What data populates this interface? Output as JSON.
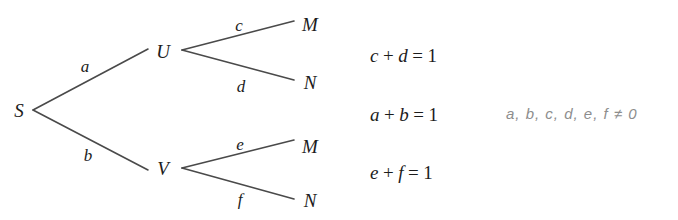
{
  "figure": {
    "type": "probability-tree-diagram",
    "background_color": "#ffffff",
    "line_color": "#4a4a4a",
    "text_color": "#1c1c1c",
    "note_color": "#8d8d8d"
  },
  "tree": {
    "root": {
      "label": "S",
      "x": 18,
      "y": 110
    },
    "nodes": [
      {
        "name": "root",
        "label": "S",
        "x": 18,
        "y": 110
      },
      {
        "name": "upper-mid",
        "label": "U",
        "x": 163,
        "y": 51
      },
      {
        "name": "lower-mid",
        "label": "V",
        "x": 163,
        "y": 168
      },
      {
        "name": "upper-leaf-m",
        "label": "M",
        "x": 310,
        "y": 24
      },
      {
        "name": "upper-leaf-n",
        "label": "N",
        "x": 310,
        "y": 82
      },
      {
        "name": "lower-leaf-m",
        "label": "M",
        "x": 310,
        "y": 146
      },
      {
        "name": "lower-leaf-n",
        "label": "N",
        "x": 310,
        "y": 200
      }
    ],
    "edges": [
      {
        "name": "edge-s-u",
        "label": "a",
        "from": "S",
        "to": "U",
        "label_x": 84,
        "label_y": 66
      },
      {
        "name": "edge-s-v",
        "label": "b",
        "from": "S",
        "to": "V",
        "label_x": 87,
        "label_y": 155
      },
      {
        "name": "edge-u-m",
        "label": "c",
        "from": "U",
        "to": "M",
        "label_x": 238,
        "label_y": 25
      },
      {
        "name": "edge-u-n",
        "label": "d",
        "from": "U",
        "to": "N",
        "label_x": 240,
        "label_y": 86
      },
      {
        "name": "edge-v-m",
        "label": "e",
        "from": "V",
        "to": "M",
        "label_x": 239,
        "label_y": 144
      },
      {
        "name": "edge-v-n",
        "label": "f",
        "from": "V",
        "to": "N",
        "label_x": 239,
        "label_y": 200
      }
    ],
    "lines": [
      {
        "name": "line-s-u",
        "x1": 33,
        "y1": 110,
        "x2": 148,
        "y2": 49
      },
      {
        "name": "line-s-v",
        "x1": 33,
        "y1": 110,
        "x2": 148,
        "y2": 170
      },
      {
        "name": "line-u-m",
        "x1": 182,
        "y1": 50,
        "x2": 294,
        "y2": 21
      },
      {
        "name": "line-u-n",
        "x1": 182,
        "y1": 50,
        "x2": 294,
        "y2": 80
      },
      {
        "name": "line-v-m",
        "x1": 182,
        "y1": 168,
        "x2": 294,
        "y2": 140
      },
      {
        "name": "line-v-n",
        "x1": 182,
        "y1": 168,
        "x2": 294,
        "y2": 199
      }
    ]
  },
  "equations": [
    {
      "name": "equation-cd",
      "text": "c + d = 1",
      "left": "c",
      "op1": "+",
      "right": "d",
      "eq": "=",
      "value": "1",
      "x": 370,
      "y": 46
    },
    {
      "name": "equation-ab",
      "text": "a + b = 1",
      "left": "a",
      "op1": "+",
      "right": "b",
      "eq": "=",
      "value": "1",
      "x": 370,
      "y": 105
    },
    {
      "name": "equation-ef",
      "text": "e + f = 1",
      "left": "e",
      "op1": "+",
      "right": "f",
      "eq": "=",
      "value": "1",
      "x": 370,
      "y": 163
    }
  ],
  "constraint": {
    "name": "constraint-nonzero",
    "text": "a, b, c, d, e, f ≠ 0",
    "x": 506,
    "y": 106
  }
}
